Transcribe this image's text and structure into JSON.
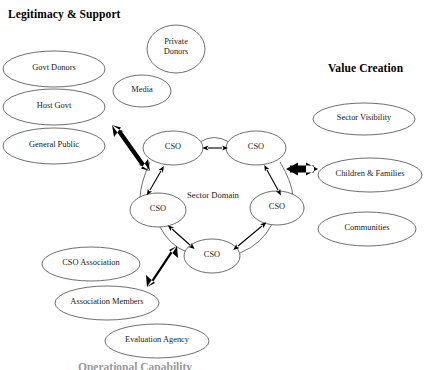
{
  "diagram": {
    "background_color": "#ffffff",
    "ellipse_stroke_color": "#555555",
    "arrow_thin_color": "#000000",
    "arrow_thick_color": "#000000",
    "text_color": "#1a1a1a"
  },
  "headers": [
    {
      "id": "legitimacy",
      "label": "Legitimacy & Support",
      "x": 8,
      "y": 8
    },
    {
      "id": "value_creation",
      "label": "Value Creation",
      "x": 328,
      "y": 62
    },
    {
      "id": "operational",
      "label": "Operational Capability",
      "x": 78,
      "y": 361
    }
  ],
  "center": {
    "label": "Sector Domain",
    "x": 213,
    "y": 196
  },
  "cso_nodes": [
    {
      "id": "cso-top-left",
      "label": "CSO",
      "cx": 173,
      "cy": 148,
      "rx": 30,
      "ry": 17
    },
    {
      "id": "cso-top-right",
      "label": "CSO",
      "cx": 256,
      "cy": 148,
      "rx": 30,
      "ry": 17
    },
    {
      "id": "cso-left",
      "label": "CSO",
      "cx": 158,
      "cy": 210,
      "rx": 28,
      "ry": 17
    },
    {
      "id": "cso-right",
      "label": "CSO",
      "cx": 277,
      "cy": 208,
      "rx": 27,
      "ry": 17
    },
    {
      "id": "cso-bottom",
      "label": "CSO",
      "cx": 212,
      "cy": 256,
      "rx": 28,
      "ry": 17
    }
  ],
  "stakeholders": [
    {
      "id": "govt-donors",
      "label": "Govt Donors",
      "cluster": "legitimacy",
      "cx": 54,
      "cy": 69,
      "rx": 51,
      "ry": 18
    },
    {
      "id": "host-govt",
      "label": "Host Govt",
      "cluster": "legitimacy",
      "cx": 54,
      "cy": 107,
      "rx": 51,
      "ry": 18
    },
    {
      "id": "general-public",
      "label": "General Public",
      "cluster": "legitimacy",
      "cx": 54,
      "cy": 146,
      "rx": 51,
      "ry": 18
    },
    {
      "id": "private-donors",
      "label": "Private\nDonors",
      "cluster": "legitimacy",
      "cx": 176,
      "cy": 49,
      "rx": 29,
      "ry": 24
    },
    {
      "id": "media",
      "label": "Media",
      "cluster": "legitimacy",
      "cx": 142,
      "cy": 91,
      "rx": 29,
      "ry": 16
    },
    {
      "id": "sector-visibility",
      "label": "Sector Visibility",
      "cluster": "value",
      "cx": 364,
      "cy": 119,
      "rx": 51,
      "ry": 16
    },
    {
      "id": "children-families",
      "label": "Children & Families",
      "cluster": "value",
      "cx": 370,
      "cy": 175,
      "rx": 52,
      "ry": 17
    },
    {
      "id": "communities",
      "label": "Communities",
      "cluster": "value",
      "cx": 367,
      "cy": 229,
      "rx": 49,
      "ry": 17
    },
    {
      "id": "cso-association",
      "label": "CSO Association",
      "cluster": "operational",
      "cx": 91,
      "cy": 264,
      "rx": 49,
      "ry": 17
    },
    {
      "id": "association-members",
      "label": "Association Members",
      "cluster": "operational",
      "cx": 107,
      "cy": 303,
      "rx": 52,
      "ry": 17
    },
    {
      "id": "evaluation-agency",
      "label": "Evaluation Agency",
      "cluster": "operational",
      "cx": 157,
      "cy": 341,
      "rx": 52,
      "ry": 17
    }
  ],
  "thick_arrows": [
    {
      "id": "arrow-legitimacy",
      "direction": "bidirectional",
      "x1": 148,
      "y1": 174,
      "x2": 113,
      "y2": 126
    },
    {
      "id": "arrow-value",
      "direction": "bidirectional",
      "x1": 288,
      "y1": 169,
      "x2": 317,
      "y2": 169
    },
    {
      "id": "arrow-operational",
      "direction": "bidirectional",
      "x1": 145,
      "y1": 288,
      "x2": 178,
      "y2": 243
    }
  ],
  "thin_arrows": [
    {
      "id": "link-topleft-topright",
      "from": "cso-top-left",
      "to": "cso-top-right",
      "direction": "bidirectional"
    },
    {
      "id": "link-topleft-left",
      "from": "cso-top-left",
      "to": "cso-left",
      "direction": "bidirectional"
    },
    {
      "id": "link-topright-right",
      "from": "cso-top-right",
      "to": "cso-right",
      "direction": "bidirectional"
    },
    {
      "id": "link-left-bottom",
      "from": "cso-left",
      "to": "cso-bottom",
      "direction": "bidirectional"
    },
    {
      "id": "link-right-bottom",
      "from": "cso-right",
      "to": "cso-bottom",
      "direction": "bidirectional"
    }
  ]
}
